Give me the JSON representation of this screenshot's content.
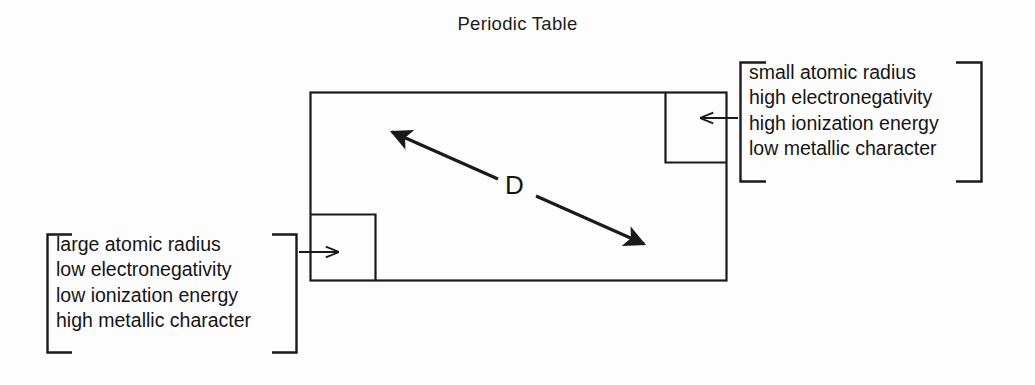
{
  "figure": {
    "title": "Periodic Table",
    "diagonal_label": "D"
  },
  "annotations": {
    "right": {
      "name": "right-trend-callout",
      "lines": [
        "small atomic radius",
        "high electronegativity",
        "high ionization energy",
        "low metallic character"
      ]
    },
    "left": {
      "name": "left-trend-callout",
      "lines": [
        "large atomic radius",
        "low electronegativity",
        "low ionization energy",
        "high metallic character"
      ]
    }
  },
  "colors": {
    "background": "#fdfdfd",
    "ink": "#151515",
    "line": "#1a1a1a"
  }
}
